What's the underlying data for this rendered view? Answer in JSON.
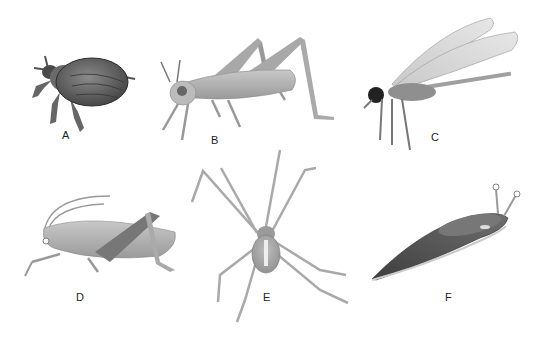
{
  "figure": {
    "specimens": [
      {
        "label": "A",
        "subject": "beetle"
      },
      {
        "label": "B",
        "subject": "grasshopper"
      },
      {
        "label": "C",
        "subject": "dragonfly"
      },
      {
        "label": "D",
        "subject": "cricket"
      },
      {
        "label": "E",
        "subject": "spider"
      },
      {
        "label": "F",
        "subject": "slug"
      }
    ]
  }
}
